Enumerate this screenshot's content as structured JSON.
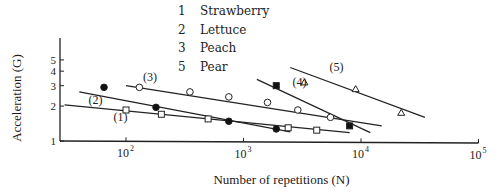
{
  "chart_data": {
    "type": "line",
    "title": "",
    "xlabel": "Number of repetitions (N)",
    "ylabel": "Acceleration (G)",
    "xscale": "log",
    "yscale": "log",
    "xlim": [
      25,
      100000
    ],
    "ylim": [
      1,
      6
    ],
    "x_ticks": [
      {
        "value": 100,
        "label": "10²"
      },
      {
        "value": 1000,
        "label": "10³"
      },
      {
        "value": 10000,
        "label": "10⁴"
      },
      {
        "value": 100000,
        "label": "10⁵"
      }
    ],
    "y_ticks": [
      {
        "value": 1,
        "label": "1"
      },
      {
        "value": 2,
        "label": "2"
      },
      {
        "value": 3,
        "label": "3"
      },
      {
        "value": 4,
        "label": "4"
      },
      {
        "value": 5,
        "label": "5"
      }
    ],
    "grid": false,
    "legend_position": "top-center",
    "legend": [
      {
        "id": "1",
        "label": "Strawberry"
      },
      {
        "id": "2",
        "label": "Lettuce"
      },
      {
        "id": "3",
        "label": "Peach"
      },
      {
        "id": "5",
        "label": "Pear"
      }
    ],
    "series": [
      {
        "name": "(1)",
        "legend_label": "Strawberry",
        "marker": "open-square",
        "points": [
          [
            100,
            1.85
          ],
          [
            200,
            1.7
          ],
          [
            500,
            1.55
          ],
          [
            2400,
            1.3
          ],
          [
            4200,
            1.24
          ]
        ],
        "fit_line": [
          [
            30,
            2.05
          ],
          [
            8000,
            1.18
          ]
        ],
        "label_pos": [
          90,
          1.5
        ]
      },
      {
        "name": "(2)",
        "legend_label": "Lettuce",
        "marker": "filled-circle",
        "points": [
          [
            65,
            2.9
          ],
          [
            180,
            1.95
          ],
          [
            750,
            1.48
          ],
          [
            1900,
            1.27
          ]
        ],
        "fit_line": [
          [
            40,
            2.65
          ],
          [
            2500,
            1.2
          ]
        ],
        "label_pos": [
          55,
          2.1
        ]
      },
      {
        "name": "(3)",
        "legend_label": "Peach",
        "marker": "open-circle",
        "points": [
          [
            130,
            2.9
          ],
          [
            350,
            2.65
          ],
          [
            750,
            2.4
          ],
          [
            1600,
            2.15
          ],
          [
            2900,
            1.85
          ],
          [
            5500,
            1.6
          ]
        ],
        "fit_line": [
          [
            100,
            3.0
          ],
          [
            15000,
            1.35
          ]
        ],
        "label_pos": [
          160,
          3.3
        ]
      },
      {
        "name": "(4)",
        "legend_label": "",
        "marker": "filled-square",
        "points": [
          [
            1900,
            3.0
          ],
          [
            8000,
            1.35
          ]
        ],
        "fit_line": [
          [
            1300,
            3.4
          ],
          [
            12000,
            1.18
          ]
        ],
        "label_pos": [
          3000,
          3.0
        ]
      },
      {
        "name": "(5)",
        "legend_label": "Pear",
        "marker": "open-triangle",
        "points": [
          [
            3300,
            3.2
          ],
          [
            9000,
            2.8
          ],
          [
            22000,
            1.75
          ]
        ],
        "fit_line": [
          [
            2500,
            4.3
          ],
          [
            35000,
            1.6
          ]
        ],
        "label_pos": [
          6200,
          4.0
        ]
      }
    ]
  },
  "axes": {
    "x_label": "Number of repetitions (N)",
    "y_label": "Acceleration (G)"
  },
  "legend": [
    {
      "num": "1",
      "label": "Strawberry"
    },
    {
      "num": "2",
      "label": "Lettuce"
    },
    {
      "num": "3",
      "label": "Peach"
    },
    {
      "num": "5",
      "label": "Pear"
    }
  ]
}
